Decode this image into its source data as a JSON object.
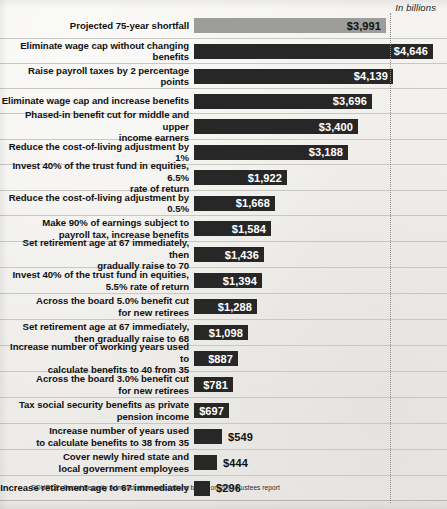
{
  "unit_label": "In billions",
  "source_note": "SOURCE: Social Security Administration calculations based on 2004 trustees report",
  "colors": {
    "benchmark_bar": "#9d9d9b",
    "option_bar": "#272727",
    "page_background": "#f2f1ee",
    "rule": "#c9c7c2",
    "dotted_reference_line": "#8e8c88"
  },
  "chart_data": {
    "type": "bar",
    "orientation": "horizontal",
    "title": "",
    "subtitle": "",
    "xlabel": "In billions",
    "ylabel": "",
    "xlim": [
      0,
      4646
    ],
    "grid": false,
    "legend": null,
    "annotations": [
      "SOURCE: Social Security Administration calculations based on 2004 trustees report"
    ],
    "reference_line": {
      "label": "Projected 75-year shortfall",
      "value": 3991
    },
    "categories": [
      "Projected 75-year shortfall",
      "Eliminate wage cap without changing benefits",
      "Raise payroll taxes by 2 percentage points",
      "Eliminate wage cap and increase benefits",
      "Phased-in benefit cut for middle and upper income earners",
      "Reduce the cost-of-living adjustment by 1%",
      "Invest 40% of the trust fund in equities, 6.5% rate of return",
      "Reduce the cost-of-living adjustment by 0.5%",
      "Make 90% of earnings subject to payroll tax, increase benefits",
      "Set retirement age at 67 immediately, then gradually raise to 70",
      "Invest 40% of the trust fund in equities, 5.5% rate of return",
      "Across the board 5.0% benefit cut for new retirees",
      "Set retirement age at 67 immediately, then gradually raise to 68",
      "Increase number of working years used to calculate benefits to 40 from 35",
      "Across the board 3.0% benefit cut for new retirees",
      "Tax social security benefits as private pension income",
      "Increase number of years used to calculate benefits to 38 from 35",
      "Cover newly hired state and local government employees",
      "Increase retirement age to 67 immediately"
    ],
    "values": [
      3991,
      4646,
      4139,
      3696,
      3400,
      3188,
      1922,
      1668,
      1584,
      1436,
      1394,
      1288,
      1098,
      887,
      781,
      697,
      549,
      444,
      296
    ]
  },
  "rows": [
    {
      "label_line1": "Projected 75-year shortfall",
      "label_line2": "",
      "value": 3991,
      "value_text": "$3,991",
      "bar_width_px": 192,
      "row_height_px": 26,
      "style": "benchmark",
      "label_position": "inside"
    },
    {
      "label_line1": "Eliminate wage cap without changing benefits",
      "label_line2": "",
      "value": 4646,
      "value_text": "$4,646",
      "bar_width_px": 239,
      "row_height_px": 25,
      "style": "option",
      "label_position": "inside"
    },
    {
      "label_line1": "Raise payroll taxes by 2 percentage points",
      "label_line2": "",
      "value": 4139,
      "value_text": "$4,139",
      "bar_width_px": 199,
      "row_height_px": 25,
      "style": "option",
      "label_position": "inside"
    },
    {
      "label_line1": "Eliminate wage cap and increase benefits",
      "label_line2": "",
      "value": 3696,
      "value_text": "$3,696",
      "bar_width_px": 178,
      "row_height_px": 25,
      "style": "option",
      "label_position": "inside"
    },
    {
      "label_line1": "Phased-in benefit cut for middle and upper",
      "label_line2": "income earners",
      "value": 3400,
      "value_text": "$3,400",
      "bar_width_px": 164,
      "row_height_px": 26,
      "style": "option",
      "label_position": "inside"
    },
    {
      "label_line1": "Reduce the cost-of-living adjustment by 1%",
      "label_line2": "",
      "value": 3188,
      "value_text": "$3,188",
      "bar_width_px": 154,
      "row_height_px": 25,
      "style": "option",
      "label_position": "inside"
    },
    {
      "label_line1": "Invest 40% of the trust fund in equities, 6.5%",
      "label_line2": "rate of return",
      "value": 1922,
      "value_text": "$1,922",
      "bar_width_px": 93,
      "row_height_px": 26,
      "style": "option",
      "label_position": "inside"
    },
    {
      "label_line1": "Reduce the cost-of-living adjustment by 0.5%",
      "label_line2": "",
      "value": 1668,
      "value_text": "$1,668",
      "bar_width_px": 81,
      "row_height_px": 25,
      "style": "option",
      "label_position": "inside"
    },
    {
      "label_line1": "Make 90% of earnings subject to",
      "label_line2": "payroll tax, increase benefits",
      "value": 1584,
      "value_text": "$1,584",
      "bar_width_px": 77,
      "row_height_px": 26,
      "style": "option",
      "label_position": "inside"
    },
    {
      "label_line1": "Set retirement age at 67 immediately, then",
      "label_line2": "gradually raise to 70",
      "value": 1436,
      "value_text": "$1,436",
      "bar_width_px": 70,
      "row_height_px": 26,
      "style": "option",
      "label_position": "inside"
    },
    {
      "label_line1": "Invest 40% of the trust fund in equities,",
      "label_line2": "5.5% rate of return",
      "value": 1394,
      "value_text": "$1,394",
      "bar_width_px": 68,
      "row_height_px": 26,
      "style": "option",
      "label_position": "inside"
    },
    {
      "label_line1": "Across the board 5.0% benefit cut",
      "label_line2": "for new retirees",
      "value": 1288,
      "value_text": "$1,288",
      "bar_width_px": 63,
      "row_height_px": 26,
      "style": "option",
      "label_position": "inside"
    },
    {
      "label_line1": "Set retirement age at 67 immediately,",
      "label_line2": "then gradually raise to 68",
      "value": 1098,
      "value_text": "$1,098",
      "bar_width_px": 54,
      "row_height_px": 26,
      "style": "option",
      "label_position": "inside"
    },
    {
      "label_line1": "Increase number of working years used to",
      "label_line2": "calculate benefits to 40 from 35",
      "value": 887,
      "value_text": "$887",
      "bar_width_px": 44,
      "row_height_px": 26,
      "style": "option",
      "label_position": "inside"
    },
    {
      "label_line1": "Across the board 3.0% benefit cut",
      "label_line2": "for new retirees",
      "value": 781,
      "value_text": "$781",
      "bar_width_px": 39,
      "row_height_px": 26,
      "style": "option",
      "label_position": "inside"
    },
    {
      "label_line1": "Tax social security benefits as private",
      "label_line2": "pension income",
      "value": 697,
      "value_text": "$697",
      "bar_width_px": 35,
      "row_height_px": 26,
      "style": "option",
      "label_position": "inside"
    },
    {
      "label_line1": "Increase number of years used",
      "label_line2": "to calculate benefits to 38 from 35",
      "value": 549,
      "value_text": "$549",
      "bar_width_px": 28,
      "row_height_px": 26,
      "style": "option",
      "label_position": "outside"
    },
    {
      "label_line1": "Cover newly hired state and",
      "label_line2": "local government employees",
      "value": 444,
      "value_text": "$444",
      "bar_width_px": 23,
      "row_height_px": 26,
      "style": "option",
      "label_position": "outside"
    },
    {
      "label_line1": "Increase retirement age to 67 immediately",
      "label_line2": "",
      "value": 296,
      "value_text": "$296",
      "bar_width_px": 16,
      "row_height_px": 25,
      "style": "option",
      "label_position": "outside"
    }
  ]
}
